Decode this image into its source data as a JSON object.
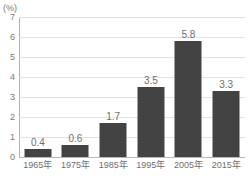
{
  "chart_data": {
    "type": "bar",
    "title": "",
    "xlabel": "",
    "ylabel": "",
    "unit_label": "(%)",
    "categories": [
      "1965年",
      "1975年",
      "1985年",
      "1995年",
      "2005年",
      "2015年"
    ],
    "values": [
      0.4,
      0.6,
      1.7,
      3.5,
      5.8,
      3.3
    ],
    "value_labels": [
      "0.4",
      "0.6",
      "1.7",
      "3.5",
      "5.8",
      "3.3"
    ],
    "ylim": [
      0,
      7
    ],
    "ytick_step": 1,
    "yticks": [
      0,
      1,
      2,
      3,
      4,
      5,
      6,
      7
    ],
    "ytick_labels": [
      "0",
      "1",
      "2",
      "3",
      "4",
      "5",
      "6",
      "7"
    ],
    "grid": "horizontal",
    "legend": "none",
    "series": [
      {
        "name": "",
        "values": [
          0.4,
          0.6,
          1.7,
          3.5,
          5.8,
          3.3
        ],
        "color": "#434343"
      }
    ],
    "colors": {
      "bar": "#434343",
      "gridline": "#e2e2e2",
      "axis": "#b0b0b0",
      "baseline": "#b8b8b8",
      "text": "#6e6e6e",
      "background": "#ffffff"
    }
  }
}
